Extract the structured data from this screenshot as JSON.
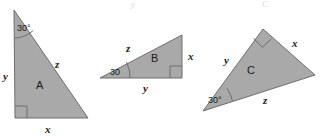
{
  "figure": {
    "background_color": "#ffffff",
    "fill_color": "#a9a9a9",
    "stroke_color": "#6e6e6e",
    "text_color": "#1a1a1a",
    "width": 321,
    "height": 136
  },
  "triangles": [
    {
      "name": "A",
      "label": "A",
      "angle": "30°",
      "sides": {
        "x": "x",
        "y": "y",
        "z": "z"
      },
      "has_right_angle_mark": true,
      "right_angle_location": "bottom-left",
      "angle_location": "top",
      "points": "14,10 88,118 15,118"
    },
    {
      "name": "B",
      "label": "B",
      "angle": "30",
      "sides": {
        "x": "x",
        "y": "y",
        "z": "z"
      },
      "has_right_angle_mark": true,
      "right_angle_location": "bottom-right",
      "angle_location": "left",
      "points": "100,78 182,35 182,78"
    },
    {
      "name": "C",
      "label": "C",
      "angle": "30°",
      "sides": {
        "x": "x",
        "y": "y",
        "z": "z"
      },
      "has_right_angle_mark": true,
      "right_angle_location": "top",
      "angle_location": "bottom-left",
      "points": "263,29 315,75 203,111"
    }
  ],
  "artifacts": {
    "top_mark_1": "y",
    "top_mark_2": "C"
  }
}
